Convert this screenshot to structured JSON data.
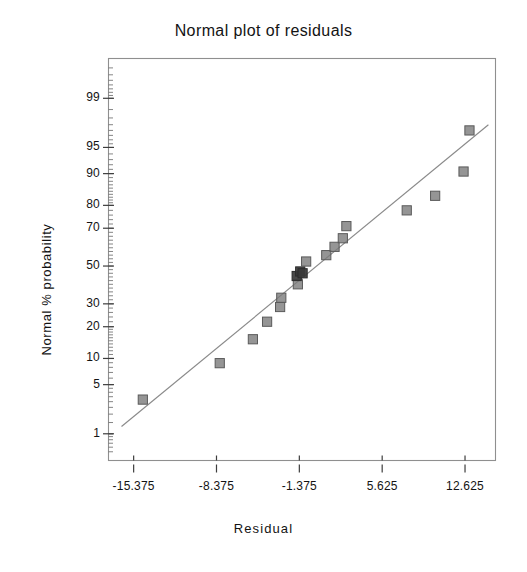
{
  "chart_data": {
    "type": "scatter",
    "title": "Normal plot of residuals",
    "xlabel": "Residual",
    "ylabel": "Normal % probability",
    "grid": false,
    "legend": null,
    "x_ticks": [
      "-15.375",
      "-8.375",
      "-1.375",
      "5.625",
      "12.625"
    ],
    "x_tick_values": [
      -15.375,
      -8.375,
      -1.375,
      5.625,
      12.625
    ],
    "xlim": [
      -17.5,
      15.2
    ],
    "y_ticks": [
      "1",
      "5",
      "10",
      "20",
      "30",
      "50",
      "70",
      "80",
      "90",
      "95",
      "99"
    ],
    "y_tick_values": [
      1,
      5,
      10,
      20,
      30,
      50,
      70,
      80,
      90,
      95,
      99
    ],
    "ylim": [
      0.35,
      99.8
    ],
    "y_scale": "normal-probability",
    "marker": "filled-square",
    "marker_color": "#7b7b7b",
    "marker_edge_color": "#5a5a5a",
    "overlap_marker_color": "#3a3a3a",
    "reference_line_color": "#8a8a8a",
    "reference_line": {
      "x1": -16.4,
      "y1": 1.3,
      "x2": 14.6,
      "y2": 97.5
    },
    "points": [
      {
        "x": -14.6,
        "y": 3.2,
        "overlap": false
      },
      {
        "x": -8.1,
        "y": 8.9,
        "overlap": false
      },
      {
        "x": -5.3,
        "y": 15.5,
        "overlap": false
      },
      {
        "x": -4.1,
        "y": 22.0,
        "overlap": false
      },
      {
        "x": -3.0,
        "y": 28.5,
        "overlap": false
      },
      {
        "x": -2.9,
        "y": 33.0,
        "overlap": false
      },
      {
        "x": -1.5,
        "y": 40.0,
        "overlap": false
      },
      {
        "x": -1.6,
        "y": 44.5,
        "overlap": true
      },
      {
        "x": -1.3,
        "y": 47.0,
        "overlap": true
      },
      {
        "x": -1.1,
        "y": 46.0,
        "overlap": true
      },
      {
        "x": -0.8,
        "y": 52.5,
        "overlap": false
      },
      {
        "x": 0.9,
        "y": 56.0,
        "overlap": false
      },
      {
        "x": 1.6,
        "y": 60.5,
        "overlap": false
      },
      {
        "x": 2.3,
        "y": 65.0,
        "overlap": false
      },
      {
        "x": 2.6,
        "y": 71.0,
        "overlap": false
      },
      {
        "x": 7.7,
        "y": 78.0,
        "overlap": false
      },
      {
        "x": 10.1,
        "y": 83.5,
        "overlap": false
      },
      {
        "x": 12.5,
        "y": 90.5,
        "overlap": false
      },
      {
        "x": 13.0,
        "y": 97.0,
        "overlap": false
      }
    ],
    "minor_tick_count": 44
  },
  "plot": {
    "frame_color": "#8f8f8f",
    "background": "#ffffff"
  }
}
